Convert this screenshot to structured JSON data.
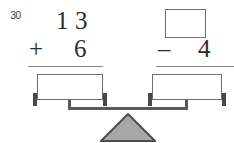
{
  "problem": {
    "number": "30",
    "type": "balance-scale-equation",
    "statement": "13 + 6 = ? - 4"
  },
  "left_expression": {
    "top_number": "13",
    "top_digit_tens": "1",
    "top_digit_ones": "3",
    "operator": "+",
    "bottom_number": "6",
    "answer_value": ""
  },
  "right_expression": {
    "top_number": "",
    "operator": "–",
    "bottom_number": "4",
    "answer_value": ""
  },
  "scale": {
    "left_pan_label": "",
    "right_pan_label": "",
    "fulcrum_label": "",
    "balanced": true
  },
  "colors": {
    "ink": "#2b2b2b",
    "line": "#6e6e6e",
    "rule": "#8a8a8a",
    "post": "#4a4a4a",
    "beam": "#5a5a5a",
    "fulcrum_fill": "#a8a8a8",
    "fulcrum_stroke": "#4d4d4d",
    "background": "#ffffff"
  }
}
